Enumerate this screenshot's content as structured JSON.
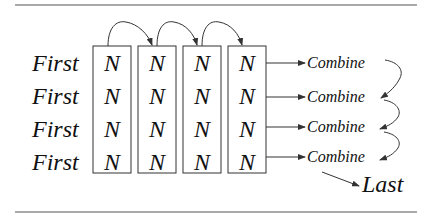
{
  "diagram": {
    "rows": [
      {
        "label": "First",
        "cells": [
          "N",
          "N",
          "N",
          "N"
        ],
        "output": "Combine"
      },
      {
        "label": "First",
        "cells": [
          "N",
          "N",
          "N",
          "N"
        ],
        "output": "Combine"
      },
      {
        "label": "First",
        "cells": [
          "N",
          "N",
          "N",
          "N"
        ],
        "output": "Combine"
      },
      {
        "label": "First",
        "cells": [
          "N",
          "N",
          "N",
          "N"
        ],
        "output": "Combine"
      }
    ],
    "final": "Last",
    "columns": 4,
    "column_chain_arrows": 3,
    "combine_chain_arrows": 3
  }
}
